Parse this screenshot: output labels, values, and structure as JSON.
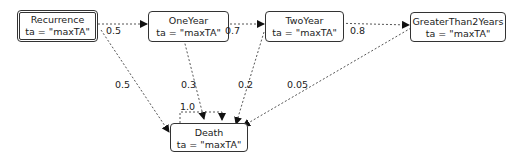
{
  "diagram": {
    "type": "state-transition",
    "nodes": [
      {
        "id": "recurrence",
        "name": "Recurrence",
        "attr": "ta = \"maxTA\"",
        "initial": true
      },
      {
        "id": "oneyear",
        "name": "OneYear",
        "attr": "ta = \"maxTA\""
      },
      {
        "id": "twoyear",
        "name": "TwoYear",
        "attr": "ta = \"maxTA\""
      },
      {
        "id": "gt2",
        "name": "GreaterThan2Years",
        "attr": "ta = \"maxTA\""
      },
      {
        "id": "death",
        "name": "Death",
        "attr": "ta = \"maxTA\""
      }
    ],
    "edges": [
      {
        "from": "Recurrence",
        "to": "OneYear",
        "label": "0.5"
      },
      {
        "from": "OneYear",
        "to": "TwoYear",
        "label": "0.7"
      },
      {
        "from": "TwoYear",
        "to": "GreaterThan2Years",
        "label": "0.8"
      },
      {
        "from": "Recurrence",
        "to": "Death",
        "label": "0.5"
      },
      {
        "from": "OneYear",
        "to": "Death",
        "label": "0.3"
      },
      {
        "from": "TwoYear",
        "to": "Death",
        "label": "0.2"
      },
      {
        "from": "GreaterThan2Years",
        "to": "Death",
        "label": "0.05"
      },
      {
        "from": "Death",
        "to": "Death",
        "label": "1.0"
      }
    ]
  }
}
